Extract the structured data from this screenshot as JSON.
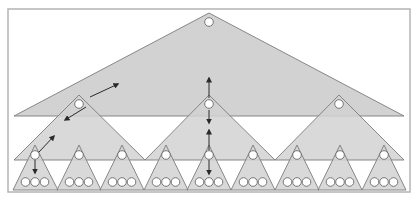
{
  "diagram": {
    "title": "",
    "colors": {
      "background": "#ffffff",
      "frame": "#b4b4b4",
      "triangle_fill": "#d2d2d2",
      "triangle_stroke": "#7c7c7c",
      "node_fill": "#ffffff",
      "node_stroke": "#6a6a6a",
      "arrow": "#2a2a2a"
    },
    "frame": {
      "x": 8,
      "y": 9,
      "w": 402,
      "h": 183
    },
    "levels": [
      {
        "name": "level-0",
        "triangles": [
          {
            "apex": [
              209,
              13
            ],
            "base_y": 116,
            "left": 14,
            "right": 404
          }
        ],
        "nodes": [
          [
            209,
            22
          ]
        ]
      },
      {
        "name": "level-1",
        "triangles": [
          {
            "apex": [
              79,
              95
            ],
            "base_y": 160,
            "left": 14,
            "right": 145
          },
          {
            "apex": [
              209,
              95
            ],
            "base_y": 160,
            "left": 145,
            "right": 275
          },
          {
            "apex": [
              339,
              95
            ],
            "base_y": 160,
            "left": 275,
            "right": 404
          }
        ],
        "nodes": [
          [
            79,
            104
          ],
          [
            209,
            104
          ],
          [
            339,
            104
          ]
        ]
      },
      {
        "name": "level-2",
        "triangles": [
          {
            "apex": [
              35,
              145
            ],
            "base_y": 190,
            "left": 13,
            "right": 58
          },
          {
            "apex": [
              79,
              145
            ],
            "base_y": 190,
            "left": 57,
            "right": 101
          },
          {
            "apex": [
              122,
              145
            ],
            "base_y": 190,
            "left": 100,
            "right": 144
          },
          {
            "apex": [
              166,
              145
            ],
            "base_y": 190,
            "left": 144,
            "right": 188
          },
          {
            "apex": [
              209,
              145
            ],
            "base_y": 190,
            "left": 187,
            "right": 231
          },
          {
            "apex": [
              253,
              145
            ],
            "base_y": 190,
            "left": 231,
            "right": 275
          },
          {
            "apex": [
              297,
              145
            ],
            "base_y": 190,
            "left": 275,
            "right": 319
          },
          {
            "apex": [
              340,
              145
            ],
            "base_y": 190,
            "left": 318,
            "right": 362
          },
          {
            "apex": [
              384,
              145
            ],
            "base_y": 190,
            "left": 362,
            "right": 406
          }
        ],
        "nodes": [
          [
            35,
            155
          ],
          [
            79,
            155
          ],
          [
            122,
            155
          ],
          [
            166,
            155
          ],
          [
            209,
            155
          ],
          [
            253,
            155
          ],
          [
            297,
            155
          ],
          [
            340,
            155
          ],
          [
            384,
            155
          ]
        ],
        "leaf_rows_y": 182,
        "leaf_count_per_triangle": 3
      }
    ],
    "arrows": [
      {
        "name": "arrow-up-right-level0",
        "from": [
          90,
          97
        ],
        "to": [
          118,
          84
        ]
      },
      {
        "name": "arrow-down-left-level1",
        "from": [
          86,
          107
        ],
        "to": [
          65,
          120
        ]
      },
      {
        "name": "arrow-up-right-level1",
        "from": [
          39,
          152
        ],
        "to": [
          54,
          136
        ]
      },
      {
        "name": "arrow-down-level2",
        "from": [
          35,
          160
        ],
        "to": [
          35,
          173
        ]
      },
      {
        "name": "arrow-up-center-top",
        "from": [
          209,
          98
        ],
        "to": [
          209,
          78
        ]
      },
      {
        "name": "arrow-down-center-mid",
        "from": [
          209,
          110
        ],
        "to": [
          209,
          123
        ]
      },
      {
        "name": "arrow-up-center-mid",
        "from": [
          209,
          150
        ],
        "to": [
          209,
          130
        ]
      },
      {
        "name": "arrow-down-center-bottom",
        "from": [
          209,
          160
        ],
        "to": [
          209,
          174
        ]
      }
    ]
  }
}
